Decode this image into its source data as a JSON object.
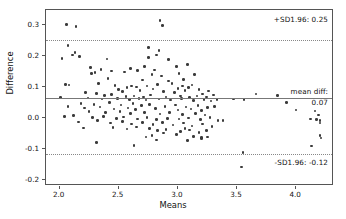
{
  "chart_data": {
    "type": "scatter",
    "title": "",
    "xlabel": "Means",
    "ylabel": "Difference",
    "xlim": [
      1.885,
      4.32
    ],
    "ylim": [
      -0.218,
      0.348
    ],
    "grid": false,
    "legend_position": "none",
    "xticks": [
      "2.0",
      "2.5",
      "3.0",
      "3.5",
      "4.0"
    ],
    "xtick_values": [
      2.0,
      2.5,
      3.0,
      3.5,
      4.0
    ],
    "yticks": [
      "0.3",
      "0.2",
      "0.1",
      "0.0",
      "-0.1",
      "-0.2"
    ],
    "ytick_values": [
      0.3,
      0.2,
      0.1,
      0.0,
      -0.1,
      -0.2
    ],
    "reference_lines": [
      {
        "name": "upper-limit-of-agreement",
        "value": 0.25,
        "style": "dotted",
        "label": "+SD1.96: 0.25"
      },
      {
        "name": "mean-difference",
        "value": 0.065,
        "style": "solid",
        "label": "mean diff:",
        "label2": "0.07"
      },
      {
        "name": "lower-limit-of-agreement",
        "value": -0.115,
        "style": "dotted",
        "label": "-SD1.96: -0.12"
      }
    ],
    "annotations": {
      "upper": "+SD1.96: 0.25",
      "mean_line1": "mean diff:",
      "mean_line2": "0.07",
      "lower": "-SD1.96: -0.12"
    },
    "marker_color": "#3a3a3a",
    "points": [
      [
        2.06,
        0.302
      ],
      [
        2.14,
        0.295
      ],
      [
        2.85,
        0.315
      ],
      [
        2.87,
        0.299
      ],
      [
        2.07,
        0.234
      ],
      [
        2.75,
        0.227
      ],
      [
        2.84,
        0.218
      ],
      [
        2.11,
        0.203
      ],
      [
        2.17,
        0.198
      ],
      [
        2.02,
        0.192
      ],
      [
        2.4,
        0.191
      ],
      [
        2.75,
        0.196
      ],
      [
        2.82,
        0.203
      ],
      [
        2.92,
        0.189
      ],
      [
        2.13,
        0.212
      ],
      [
        2.26,
        0.163
      ],
      [
        2.35,
        0.157
      ],
      [
        2.6,
        0.16
      ],
      [
        2.72,
        0.167
      ],
      [
        2.8,
        0.155
      ],
      [
        2.99,
        0.167
      ],
      [
        3.08,
        0.172
      ],
      [
        2.3,
        0.147
      ],
      [
        2.44,
        0.152
      ],
      [
        2.55,
        0.148
      ],
      [
        2.78,
        0.14
      ],
      [
        3.01,
        0.144
      ],
      [
        3.14,
        0.141
      ],
      [
        2.27,
        0.144
      ],
      [
        2.66,
        0.153
      ],
      [
        2.86,
        0.136
      ],
      [
        2.41,
        0.128
      ],
      [
        2.7,
        0.123
      ],
      [
        2.92,
        0.12
      ],
      [
        3.05,
        0.125
      ],
      [
        2.05,
        0.108
      ],
      [
        2.08,
        0.107
      ],
      [
        2.33,
        0.112
      ],
      [
        2.47,
        0.105
      ],
      [
        2.57,
        0.098
      ],
      [
        2.61,
        0.104
      ],
      [
        2.65,
        0.1
      ],
      [
        2.74,
        0.103
      ],
      [
        2.79,
        0.094
      ],
      [
        2.83,
        0.108
      ],
      [
        2.95,
        0.112
      ],
      [
        3.0,
        0.096
      ],
      [
        3.04,
        0.104
      ],
      [
        3.09,
        0.099
      ],
      [
        3.12,
        0.107
      ],
      [
        3.18,
        0.093
      ],
      [
        3.26,
        0.088
      ],
      [
        2.5,
        0.092
      ],
      [
        2.53,
        0.086
      ],
      [
        2.68,
        0.09
      ],
      [
        2.88,
        0.085
      ],
      [
        2.97,
        0.083
      ],
      [
        3.06,
        0.089
      ],
      [
        3.21,
        0.078
      ],
      [
        2.22,
        0.082
      ],
      [
        2.31,
        0.079
      ],
      [
        2.38,
        0.073
      ],
      [
        2.44,
        0.076
      ],
      [
        2.56,
        0.07
      ],
      [
        2.63,
        0.072
      ],
      [
        2.71,
        0.068
      ],
      [
        2.77,
        0.074
      ],
      [
        2.9,
        0.068
      ],
      [
        3.02,
        0.071
      ],
      [
        3.1,
        0.066
      ],
      [
        3.16,
        0.072
      ],
      [
        3.24,
        0.068
      ],
      [
        3.3,
        0.075
      ],
      [
        2.01,
        0.066
      ],
      [
        2.24,
        0.065
      ],
      [
        2.36,
        0.062
      ],
      [
        2.49,
        0.064
      ],
      [
        2.59,
        0.06
      ],
      [
        2.67,
        0.063
      ],
      [
        2.73,
        0.058
      ],
      [
        2.84,
        0.062
      ],
      [
        2.94,
        0.059
      ],
      [
        3.03,
        0.063
      ],
      [
        3.13,
        0.057
      ],
      [
        3.22,
        0.06
      ],
      [
        3.28,
        0.055
      ],
      [
        3.33,
        0.06
      ],
      [
        3.66,
        0.078
      ],
      [
        3.84,
        0.073
      ],
      [
        3.47,
        0.062
      ],
      [
        3.56,
        0.06
      ],
      [
        3.92,
        0.05
      ],
      [
        2.18,
        0.048
      ],
      [
        2.29,
        0.045
      ],
      [
        2.42,
        0.05
      ],
      [
        2.52,
        0.043
      ],
      [
        2.62,
        0.047
      ],
      [
        2.69,
        0.04
      ],
      [
        2.76,
        0.045
      ],
      [
        2.89,
        0.038
      ],
      [
        2.98,
        0.042
      ],
      [
        3.07,
        0.036
      ],
      [
        3.17,
        0.04
      ],
      [
        3.25,
        0.034
      ],
      [
        2.07,
        0.038
      ],
      [
        2.21,
        0.033
      ],
      [
        2.34,
        0.036
      ],
      [
        2.46,
        0.03
      ],
      [
        2.58,
        0.033
      ],
      [
        2.64,
        0.028
      ],
      [
        2.81,
        0.031
      ],
      [
        3.0,
        0.026
      ],
      [
        3.11,
        0.03
      ],
      [
        3.2,
        0.024
      ],
      [
        3.31,
        0.038
      ],
      [
        2.25,
        0.022
      ],
      [
        2.39,
        0.018
      ],
      [
        2.51,
        0.022
      ],
      [
        2.6,
        0.015
      ],
      [
        2.72,
        0.019
      ],
      [
        2.85,
        0.014
      ],
      [
        2.93,
        0.018
      ],
      [
        3.04,
        0.012
      ],
      [
        3.15,
        0.016
      ],
      [
        3.23,
        0.01
      ],
      [
        4.0,
        0.027
      ],
      [
        2.04,
        0.005
      ],
      [
        2.12,
        0.008
      ],
      [
        2.28,
        0.002
      ],
      [
        2.37,
        0.006
      ],
      [
        2.48,
        0.0
      ],
      [
        2.54,
        0.004
      ],
      [
        2.66,
        -0.002
      ],
      [
        2.74,
        0.002
      ],
      [
        2.82,
        -0.004
      ],
      [
        2.91,
        0.0
      ],
      [
        3.01,
        -0.003
      ],
      [
        3.09,
        0.001
      ],
      [
        3.19,
        -0.005
      ],
      [
        3.27,
        0.002
      ],
      [
        3.34,
        -0.008
      ],
      [
        4.16,
        0.023
      ],
      [
        4.19,
        0.01
      ],
      [
        4.12,
        -0.002
      ],
      [
        4.17,
        -0.005
      ],
      [
        4.2,
        -0.008
      ],
      [
        4.2,
        -0.015
      ],
      [
        2.16,
        -0.012
      ],
      [
        2.32,
        -0.008
      ],
      [
        2.43,
        -0.015
      ],
      [
        2.53,
        -0.01
      ],
      [
        2.61,
        -0.018
      ],
      [
        2.7,
        -0.013
      ],
      [
        2.79,
        -0.02
      ],
      [
        2.87,
        -0.014
      ],
      [
        2.96,
        -0.022
      ],
      [
        3.05,
        -0.016
      ],
      [
        3.12,
        -0.025
      ],
      [
        3.21,
        -0.019
      ],
      [
        3.29,
        -0.026
      ],
      [
        3.38,
        -0.008
      ],
      [
        2.2,
        -0.032
      ],
      [
        2.45,
        -0.03
      ],
      [
        2.57,
        -0.035
      ],
      [
        2.65,
        -0.028
      ],
      [
        2.76,
        -0.033
      ],
      [
        2.83,
        -0.04
      ],
      [
        2.9,
        -0.036
      ],
      [
        3.02,
        -0.042
      ],
      [
        3.1,
        -0.038
      ],
      [
        3.18,
        -0.045
      ],
      [
        3.24,
        -0.04
      ],
      [
        3.06,
        -0.033
      ],
      [
        2.78,
        -0.055
      ],
      [
        2.88,
        -0.048
      ],
      [
        2.99,
        -0.052
      ],
      [
        3.13,
        -0.058
      ],
      [
        3.2,
        -0.062
      ],
      [
        3.2,
        -0.066
      ],
      [
        3.25,
        -0.06
      ],
      [
        2.73,
        -0.06
      ],
      [
        4.2,
        -0.055
      ],
      [
        4.21,
        -0.063
      ],
      [
        2.31,
        -0.078
      ],
      [
        2.63,
        -0.088
      ],
      [
        2.82,
        -0.07
      ],
      [
        3.08,
        -0.072
      ],
      [
        4.13,
        -0.09
      ],
      [
        3.55,
        -0.11
      ],
      [
        3.54,
        -0.157
      ]
    ]
  }
}
